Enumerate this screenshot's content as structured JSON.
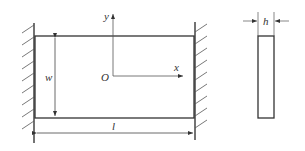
{
  "diagram": {
    "type": "clamped plate schematic",
    "plan_view": {
      "labels": {
        "width": "w",
        "length": "l",
        "origin": "O",
        "x_axis": "x",
        "y_axis": "y"
      },
      "supports": [
        "left-clamped-wall",
        "right-clamped-wall"
      ]
    },
    "side_view": {
      "labels": {
        "thickness": "h"
      }
    },
    "colors": {
      "line": "#333333",
      "wall": "#444444",
      "background": "#ffffff"
    }
  }
}
